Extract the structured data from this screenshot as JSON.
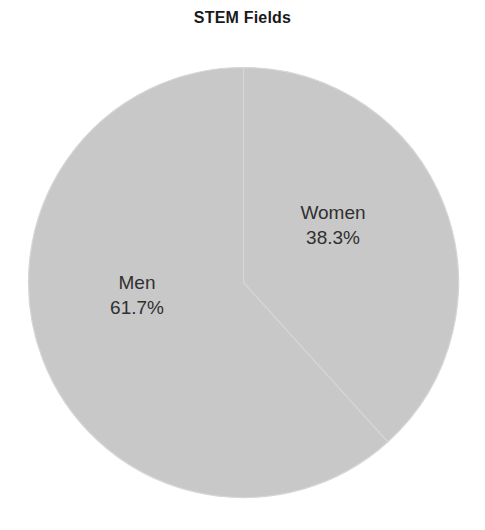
{
  "chart_data": {
    "type": "pie",
    "title": "STEM Fields",
    "xlabel": "",
    "ylabel": "",
    "categories": [
      "Women",
      "Men"
    ],
    "values": [
      38.3,
      61.7
    ],
    "value_unit": "%",
    "labels": [
      "Women\n38.3%",
      "Men\n61.7%"
    ],
    "slices": [
      {
        "name": "Women",
        "value": 38.3,
        "value_label": "38.3%",
        "color": "#c8c8c8",
        "start_angle_deg": 0,
        "end_angle_deg": 137.9
      },
      {
        "name": "Men",
        "value": 61.7,
        "value_label": "61.7%",
        "color": "#c8c8c8",
        "start_angle_deg": 137.9,
        "end_angle_deg": 360
      }
    ],
    "start_angle_deg": 90,
    "direction": "clockwise",
    "legend": null,
    "legend_position": "none",
    "grid": false,
    "wedge_edge_color": "#d6d6d6"
  },
  "figure": {
    "title": "STEM Fields",
    "background_color": "#ffffff",
    "text_color": "#303030",
    "title_color": "#1a1a1a"
  },
  "slice_women": {
    "name": "Women",
    "percent": "38.3%"
  },
  "slice_men": {
    "name": "Men",
    "percent": "61.7%"
  }
}
